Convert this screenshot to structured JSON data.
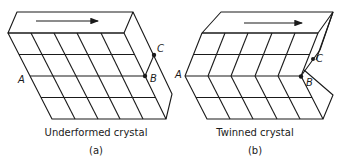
{
  "figure": {
    "panels": [
      {
        "id": "a",
        "caption": "Underformed crystal",
        "sublabel": "(a)",
        "points": {
          "A": "A",
          "B": "B",
          "C": "C"
        },
        "arrow": "shear-direction-arrow"
      },
      {
        "id": "b",
        "caption": "Twinned crystal",
        "sublabel": "(b)",
        "points": {
          "A": "A",
          "B": "B",
          "C": "C"
        },
        "arrow": "shear-direction-arrow"
      }
    ]
  }
}
